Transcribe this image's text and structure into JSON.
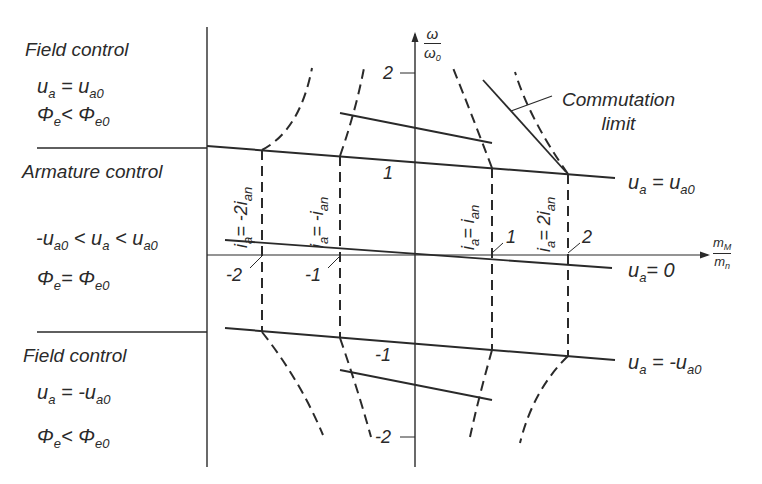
{
  "regions": [
    {
      "name": "Field control",
      "lines": [
        {
          "lhs": "u",
          "lhs_sub": "a",
          "op": "=",
          "rhs": "u",
          "rhs_sub": "a0"
        },
        {
          "lhs": "Φ",
          "lhs_sub": "e",
          "op": "<",
          "rhs": "Φ",
          "rhs_sub": "e0"
        }
      ]
    },
    {
      "name": "Armature control",
      "lines": [
        {
          "text": "-u",
          "sub1": "a0",
          "op1": "<",
          "mid": "u",
          "sub2": "a",
          "op2": "<",
          "rhs": "u",
          "sub3": "a0"
        },
        {
          "lhs": "Φ",
          "lhs_sub": "e",
          "op": "=",
          "rhs": "Φ",
          "rhs_sub": "e0"
        }
      ]
    },
    {
      "name": "Field control",
      "lines": [
        {
          "lhs": "u",
          "lhs_sub": "a",
          "op": "=",
          "rhs": "-u",
          "rhs_sub": "a0"
        },
        {
          "lhs": "Φ",
          "lhs_sub": "e",
          "op": "<",
          "rhs": "Φ",
          "rhs_sub": "e0"
        }
      ]
    }
  ],
  "axes": {
    "y": {
      "num": "ω",
      "den": "ω",
      "den_sub": "0",
      "ticks": {
        "top": "2",
        "upper": "1",
        "lower": "-1",
        "bottom": "-2"
      }
    },
    "x": {
      "num": "m",
      "num_sub": "M",
      "den": "m",
      "den_sub": "n",
      "ticks": {
        "neg2": "-2",
        "neg1": "-1",
        "pos1": "1",
        "pos2": "2"
      }
    }
  },
  "line_labels": {
    "upper": {
      "lhs": "u",
      "lhs_sub": "a",
      "op": " = ",
      "rhs": "u",
      "rhs_sub": "a0"
    },
    "middle": {
      "lhs": "u",
      "lhs_sub": "a",
      "op": "= ",
      "rhs": "0"
    },
    "lower": {
      "lhs": "u",
      "lhs_sub": "a",
      "op": " = ",
      "rhs": "-u",
      "rhs_sub": "a0"
    }
  },
  "current_labels": [
    {
      "lhs": "i",
      "lhs_sub": "a",
      "rhs": "= -2i",
      "rhs_sub": "an"
    },
    {
      "lhs": "i",
      "lhs_sub": "a",
      "rhs": "= -i",
      "rhs_sub": "an"
    },
    {
      "lhs": "i",
      "lhs_sub": "a",
      "rhs": "= i",
      "rhs_sub": "an"
    },
    {
      "lhs": "i",
      "lhs_sub": "a",
      "rhs": "= 2i",
      "rhs_sub": "an"
    }
  ],
  "annotation": {
    "line1": "Commutation",
    "line2": "limit"
  },
  "colors": {
    "ink": "#2a2a2a",
    "background": "#ffffff"
  }
}
